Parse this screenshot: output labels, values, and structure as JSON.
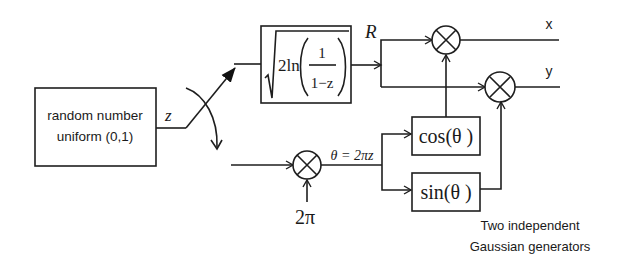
{
  "diagram": {
    "source_block": {
      "line1": "random number",
      "line2": "uniform (0,1)"
    },
    "signal_z": "z",
    "magnitude_block": {
      "coef": "2ln",
      "numerator": "1",
      "denominator": "1−z",
      "output_label": "R"
    },
    "phase": {
      "constant": "2π",
      "theta_label": "θ = 2πz"
    },
    "trig_blocks": {
      "cos": "cos(θ )",
      "sin": "sin(θ )"
    },
    "outputs": {
      "x": "x",
      "y": "y"
    },
    "caption": {
      "line1": "Two independent",
      "line2": "Gaussian generators"
    },
    "colors": {
      "line": "#1e1e1e",
      "background": "#ffffff"
    }
  }
}
